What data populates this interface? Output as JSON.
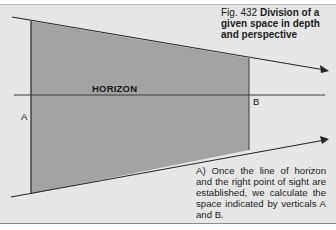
{
  "figure": {
    "number": "Fig. 432",
    "title": "Division of a given space in depth and perspective",
    "title_display": "Division of a given space in depth and perspec-tive"
  },
  "labels": {
    "horizon": "HORIZON",
    "vertical_a": "A",
    "vertical_b": "B"
  },
  "note": "A) Once the line of horizon and the right point of sight are established, we calculate the space indicated by verticals A and B.",
  "colors": {
    "background": "#e6e6e6",
    "shaded_area": "#a3a3a3",
    "lines": "#262626"
  }
}
